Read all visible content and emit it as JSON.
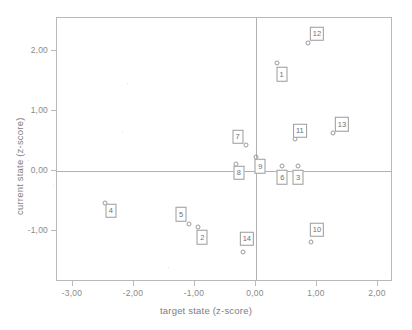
{
  "chart_data": {
    "type": "scatter",
    "title": "",
    "xlabel": "target state (z-score)",
    "ylabel": "current state (z-score)",
    "xlim": [
      -3.27,
      2.25
    ],
    "ylim": [
      -1.85,
      2.55
    ],
    "grid": false,
    "legend": "none",
    "xticks": [
      "-3,00",
      "-2,00",
      "-1,00",
      "0,00",
      "1,00",
      "2,00"
    ],
    "xtick_values": [
      -3,
      -2,
      -1,
      0,
      1,
      2
    ],
    "yticks": [
      "2,00",
      "1,00",
      "0,00",
      "-1,00"
    ],
    "ytick_values": [
      2,
      1,
      0,
      -1
    ],
    "reference_lines": {
      "x": 0,
      "y": 0
    },
    "points": [
      {
        "label": "1",
        "x": 0.34,
        "y": 1.8,
        "lx": 0.42,
        "ly": 1.61
      },
      {
        "label": "2",
        "x": -0.95,
        "y": -0.93,
        "lx": -0.88,
        "ly": -1.1
      },
      {
        "label": "3",
        "x": 0.69,
        "y": 0.08,
        "lx": 0.69,
        "ly": -0.1
      },
      {
        "label": "4",
        "x": -2.48,
        "y": -0.53,
        "lx": -2.38,
        "ly": -0.66
      },
      {
        "label": "5",
        "x": -1.1,
        "y": -0.88,
        "lx": -1.23,
        "ly": -0.72
      },
      {
        "label": "6",
        "x": 0.43,
        "y": 0.08,
        "lx": 0.43,
        "ly": -0.1
      },
      {
        "label": "7",
        "x": -0.16,
        "y": 0.43,
        "lx": -0.3,
        "ly": 0.57
      },
      {
        "label": "8",
        "x": -0.33,
        "y": 0.12,
        "lx": -0.28,
        "ly": -0.03
      },
      {
        "label": "9",
        "x": 0.0,
        "y": 0.23,
        "lx": 0.07,
        "ly": 0.08
      },
      {
        "label": "10",
        "x": 0.9,
        "y": -1.18,
        "lx": 1.0,
        "ly": -0.98
      },
      {
        "label": "11",
        "x": 0.64,
        "y": 0.53,
        "lx": 0.72,
        "ly": 0.67
      },
      {
        "label": "12",
        "x": 0.85,
        "y": 2.13,
        "lx": 1.0,
        "ly": 2.29
      },
      {
        "label": "13",
        "x": 1.26,
        "y": 0.63,
        "lx": 1.41,
        "ly": 0.78
      },
      {
        "label": "14",
        "x": -0.21,
        "y": -1.35,
        "lx": -0.15,
        "ly": -1.13
      }
    ]
  }
}
